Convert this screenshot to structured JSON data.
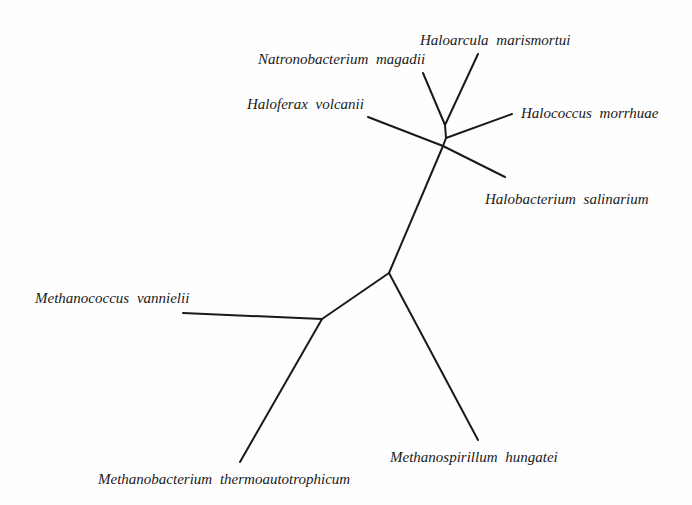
{
  "diagram": {
    "type": "unrooted-phylogenetic-tree",
    "line_color": "#1a1a1a",
    "background": "#fefefe",
    "nodes": {
      "n1": [
        445,
        125
      ],
      "n2": [
        446,
        138
      ],
      "n3": [
        443,
        146
      ],
      "n4": [
        389,
        273
      ],
      "n5": [
        322,
        319
      ]
    },
    "leaves": [
      {
        "id": "natronobacterium",
        "label": "Natronobacterium  magadii",
        "tip": [
          423,
          73
        ],
        "parent": "n1",
        "label_pos": [
          258,
          52
        ]
      },
      {
        "id": "haloarcula",
        "label": "Haloarcula  marismortui",
        "tip": [
          478,
          54
        ],
        "parent": "n1",
        "label_pos": [
          420,
          33
        ]
      },
      {
        "id": "halococcus",
        "label": "Halococcus  morrhuae",
        "tip": [
          512,
          114
        ],
        "parent": "n2",
        "label_pos": [
          521,
          106
        ]
      },
      {
        "id": "haloferax",
        "label": "Haloferax  volcanii",
        "tip": [
          368,
          117
        ],
        "parent": "n3",
        "label_pos": [
          247,
          97
        ]
      },
      {
        "id": "halobacterium",
        "label": "Halobacterium  salinarium",
        "tip": [
          505,
          177
        ],
        "parent": "n3",
        "label_pos": [
          485,
          192
        ]
      },
      {
        "id": "methanococcus",
        "label": "Methanococcus  vannielii",
        "tip": [
          183,
          313
        ],
        "parent": "n5",
        "label_pos": [
          35,
          291
        ]
      },
      {
        "id": "methanobacterium",
        "label": "Methanobacterium  thermoautotrophicum",
        "tip": [
          240,
          462
        ],
        "parent": "n5",
        "label_pos": [
          98,
          472
        ]
      },
      {
        "id": "methanospirillum",
        "label": "Methanospirillum  hungatei",
        "tip": [
          478,
          440
        ],
        "parent": "n4",
        "label_pos": [
          390,
          450
        ]
      }
    ],
    "internal_edges": [
      [
        "n1",
        "n2"
      ],
      [
        "n2",
        "n3"
      ],
      [
        "n3",
        "n4"
      ],
      [
        "n4",
        "n5"
      ]
    ]
  }
}
